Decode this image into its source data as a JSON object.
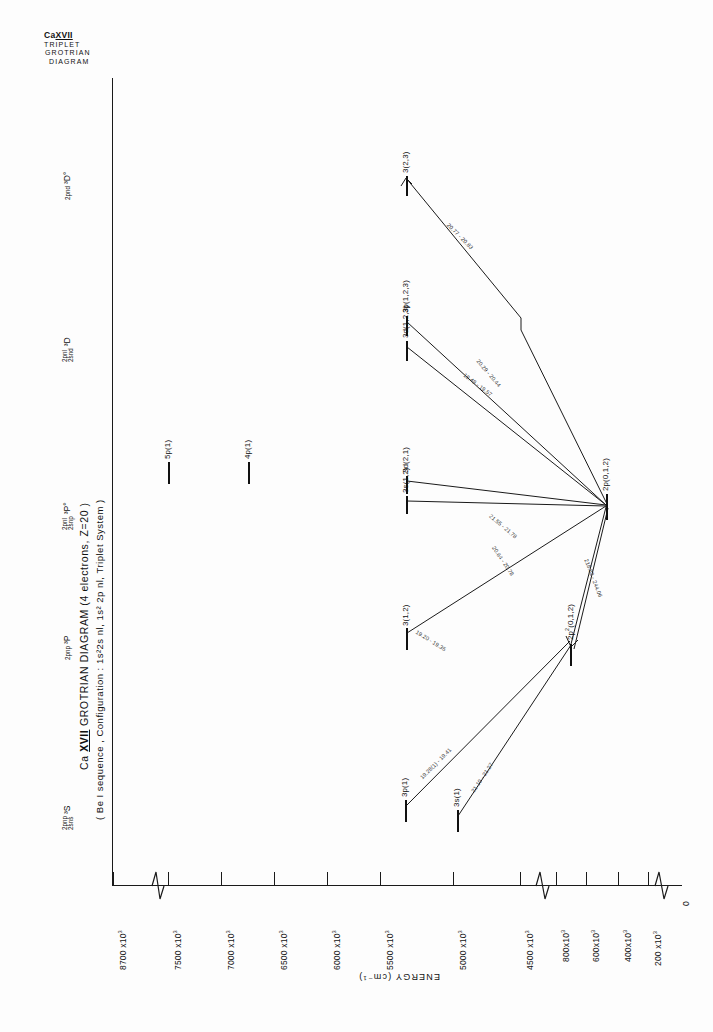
{
  "header": {
    "element": "Ca",
    "ion": "XVII",
    "line2": "TRIPLET",
    "line3": "GROTRIAN",
    "line4": "DIAGRAM"
  },
  "titles": {
    "main_pre": "Ca ",
    "main_ion": "XVII",
    "main_post": " GROTRIAN DIAGRAM (4 electrons, Z=20 )",
    "sub": "( Be I sequence , Configuration : 1s²2s nl, 1s² 2p nl, Triplet  System )"
  },
  "axis": {
    "label": "ENERGY",
    "units": "(cm⁻¹)",
    "ticks": [
      {
        "text": "8700 x10",
        "exp": "3"
      },
      {
        "text": "7500 x10",
        "exp": "3"
      },
      {
        "text": "7000 x10",
        "exp": "3"
      },
      {
        "text": "6500 x10",
        "exp": "3"
      },
      {
        "text": "6000 x10",
        "exp": "3"
      },
      {
        "text": "5500 x10",
        "exp": "3"
      },
      {
        "text": "5000 x10",
        "exp": "3"
      },
      {
        "text": "4500 x10",
        "exp": "3"
      },
      {
        "text": "800x10",
        "exp": "3"
      },
      {
        "text": "600x10",
        "exp": "3"
      },
      {
        "text": "400x10",
        "exp": "3"
      },
      {
        "text": "200 x10",
        "exp": "3"
      },
      {
        "text": "0",
        "exp": ""
      }
    ]
  },
  "columns": [
    {
      "stack_top": "2pnp",
      "stack_bot": "2sns",
      "term": "³S"
    },
    {
      "stack_top": "",
      "stack_bot": "2pnp",
      "term": "³P"
    },
    {
      "stack_top": "2pnl",
      "stack_bot": "2snp",
      "term": "³P°"
    },
    {
      "stack_top": "2pnl",
      "stack_bot": "2snd",
      "term": "³D"
    },
    {
      "stack_top": "",
      "stack_bot": "2pnd",
      "term": "³D°"
    }
  ],
  "levels": [
    {
      "label": "3p(1)"
    },
    {
      "label": "3s(1)"
    },
    {
      "label": "3(1,2)"
    },
    {
      "label": "2p²(0,1,2)"
    },
    {
      "label": "5p(1)"
    },
    {
      "label": "4p(1)"
    },
    {
      "label": "3d(2,1)"
    },
    {
      "label": "3s(1,2)"
    },
    {
      "label": "3p(1,2,3)"
    },
    {
      "label": "3d(1,2,3)"
    },
    {
      "label": "3(2,3)"
    },
    {
      "label": "2p(0,1,2)"
    }
  ],
  "transitions": [
    {
      "label": "19.28(1) - 19.41"
    },
    {
      "label": "21.10 - 21.27"
    },
    {
      "label": "19.20 - 19.35"
    },
    {
      "label": "20.64 - 20.78"
    },
    {
      "label": "21.55 - 21.78"
    },
    {
      "label": "19.48 - 19.57"
    },
    {
      "label": "20.29 - 20.44"
    },
    {
      "label": "20.77 - 20.83"
    },
    {
      "label": "218.82 - 244.06"
    }
  ],
  "colors": {
    "ink": "#1a1a1a",
    "paper": "#fdfdfd",
    "faint": "#333333"
  }
}
